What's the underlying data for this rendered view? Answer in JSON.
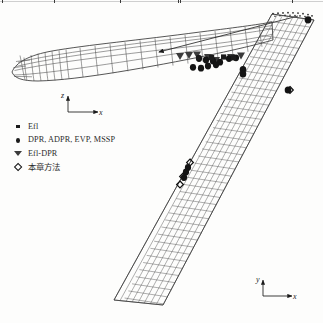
{
  "figure": {
    "kind": "engineering-mesh-figure",
    "background_color": "#fdfdfc",
    "ink_color": "#1b1b1b",
    "mesh_color": "#4a4a4a"
  },
  "legend": {
    "items": [
      {
        "marker": "filled-square-marker",
        "label": "Efl"
      },
      {
        "marker": "filled-circle-marker",
        "label": "DPR, ADPR, EVP, MSSP"
      },
      {
        "marker": "filled-triangle-marker",
        "label": "Efl-DPR"
      },
      {
        "marker": "open-diamond-marker",
        "label": "本章方法"
      }
    ]
  },
  "axes": {
    "side_view": {
      "vertical": "z",
      "horizontal": "x"
    },
    "plan_view": {
      "vertical": "y",
      "horizontal": "x"
    }
  },
  "annotations": {
    "callout": "arrow from planform root edge to side-view wing section"
  }
}
